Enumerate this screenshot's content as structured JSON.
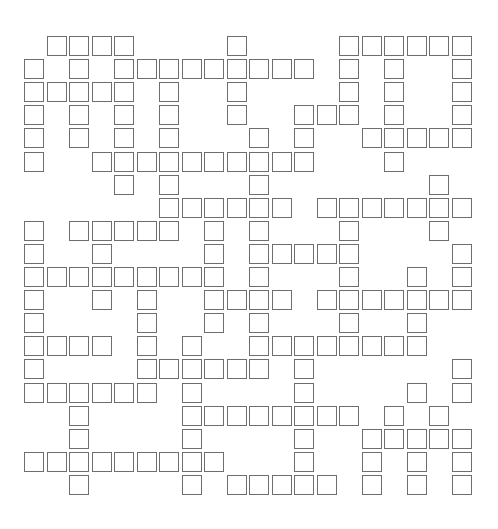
{
  "puzzle": {
    "type": "crossword",
    "rows": 20,
    "cols": 20,
    "layout": {
      "origin_x": 24,
      "origin_y": 36,
      "col_step": 22.5,
      "row_step": 23.1
    },
    "colors": {
      "cell_border": "#6e6e6e",
      "cell_fill": "#ffffff",
      "background": "#ffffff"
    },
    "grid": [
      ".####....#....######",
      "#.#.#########.#.#..#",
      "#####.#..#....#.#..#",
      "#.#.#.#..#..###.#..#",
      "#.#.#.#...#.#..#####",
      "#..##########...#...",
      "....#.#...#.......#.",
      "......######.#######",
      "#.#####.#.#...#...#.",
      "#..#....#.#####....#",
      "#########.#...#..#.#",
      "#..#.#..####.#######",
      "#....#..#.#...#..#..",
      "####.#.#..########..",
      "#....######.#......#",
      "######.#....#....#.#",
      "..#....########.#.#",
      "..#....#....#..#####",
      "#########...#..#.#.#",
      "..#....#.#####.#.#.#"
    ]
  }
}
